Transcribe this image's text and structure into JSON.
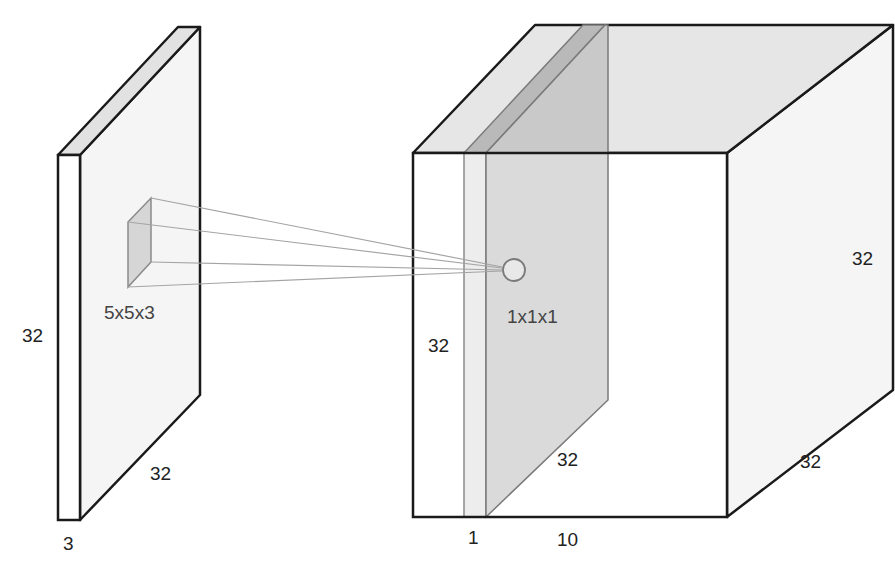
{
  "diagram": {
    "type": "convolution-illustration",
    "input_volume": {
      "height_label": "32",
      "width_label": "32",
      "depth_label": "3"
    },
    "filter": {
      "size_label": "5x5x3"
    },
    "output_volume": {
      "height_label_right": "32",
      "depth_label_right": "32",
      "width_label_bottom": "10",
      "slice_height_label": "32",
      "slice_depth_label": "32",
      "slice_thickness_label": "1",
      "neuron_label": "1x1x1"
    },
    "colors": {
      "stroke": "#1a1a1a",
      "face_light": "#f4f4f4",
      "face_top": "#e3e3e3",
      "slice_light": "#ececec",
      "slice_mid": "#d9d9d9",
      "slice_dark": "#bdbdbd",
      "cone_lines": "#a0a0a0"
    }
  }
}
